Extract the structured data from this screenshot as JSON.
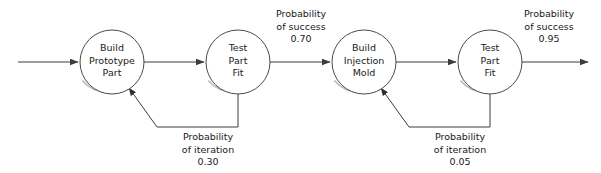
{
  "diagram": {
    "colors": {
      "line": "#3c3c3c",
      "node_stroke": "#4a4a4a",
      "node_fill": "#ffffff",
      "text": "#1a1a1a",
      "background": "#ffffff",
      "shadow": "#b9b9b9"
    },
    "nodes": [
      {
        "id": "build-prototype-part",
        "lines": [
          "Build",
          "Prototype",
          "Part"
        ],
        "cx": 112,
        "cy": 62,
        "r": 32
      },
      {
        "id": "test-part-fit-1",
        "lines": [
          "Test",
          "Part",
          "Fit"
        ],
        "cx": 238,
        "cy": 62,
        "r": 32
      },
      {
        "id": "build-injection-mold",
        "lines": [
          "Build",
          "Injection",
          "Mold"
        ],
        "cx": 364,
        "cy": 62,
        "r": 32
      },
      {
        "id": "test-part-fit-2",
        "lines": [
          "Test",
          "Part",
          "Fit"
        ],
        "cx": 490,
        "cy": 62,
        "r": 32
      }
    ],
    "annotations": [
      {
        "id": "probability-of-success-070",
        "lines": [
          "Probability",
          "of success",
          "0.70"
        ],
        "x": 301,
        "y": 17,
        "value": "0.70",
        "kind": "success"
      },
      {
        "id": "probability-of-success-095",
        "lines": [
          "Probability",
          "of success",
          "0.95"
        ],
        "x": 549,
        "y": 17,
        "value": "0.95",
        "kind": "success"
      },
      {
        "id": "probability-of-iteration-030",
        "lines": [
          "Probability",
          "of iteration",
          "0.30"
        ],
        "x": 208,
        "y": 140,
        "value": "0.30",
        "kind": "iteration"
      },
      {
        "id": "probability-of-iteration-005",
        "lines": [
          "Probability",
          "of iteration",
          "0.05"
        ],
        "x": 460,
        "y": 140,
        "value": "0.05",
        "kind": "iteration"
      }
    ],
    "edges": [
      {
        "id": "input-arrow",
        "from": "external-input",
        "to": "build-prototype-part",
        "label": ""
      },
      {
        "id": "prototype-to-test1",
        "from": "build-prototype-part",
        "to": "test-part-fit-1",
        "label": ""
      },
      {
        "id": "test1-to-mold",
        "from": "test-part-fit-1",
        "to": "build-injection-mold",
        "label": "0.70"
      },
      {
        "id": "mold-to-test2",
        "from": "build-injection-mold",
        "to": "test-part-fit-2",
        "label": ""
      },
      {
        "id": "output-arrow",
        "from": "test-part-fit-2",
        "to": "external-output",
        "label": "0.95"
      },
      {
        "id": "test1-feedback-to-prototype",
        "from": "test-part-fit-1",
        "to": "build-prototype-part",
        "label": "0.30"
      },
      {
        "id": "test2-feedback-to-mold",
        "from": "test-part-fit-2",
        "to": "build-injection-mold",
        "label": "0.05"
      }
    ]
  }
}
